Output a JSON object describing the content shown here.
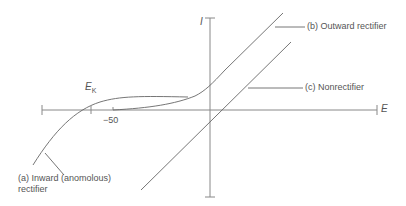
{
  "diagram": {
    "type": "current-voltage relation",
    "axes": {
      "x_label": "E",
      "y_label": "I",
      "tick_label": "−50",
      "reversal_label_main": "E",
      "reversal_label_sub": "K"
    },
    "curves": [
      {
        "id": "a",
        "label_line1": "(a) Inward (anomolous)",
        "label_line2": "rectifier"
      },
      {
        "id": "b",
        "label": "(b) Outward rectifier"
      },
      {
        "id": "c",
        "label": "(c) Nonrectifier"
      }
    ],
    "colors": {
      "axis": "#888888",
      "curve": "#666666",
      "text": "#555555"
    }
  }
}
